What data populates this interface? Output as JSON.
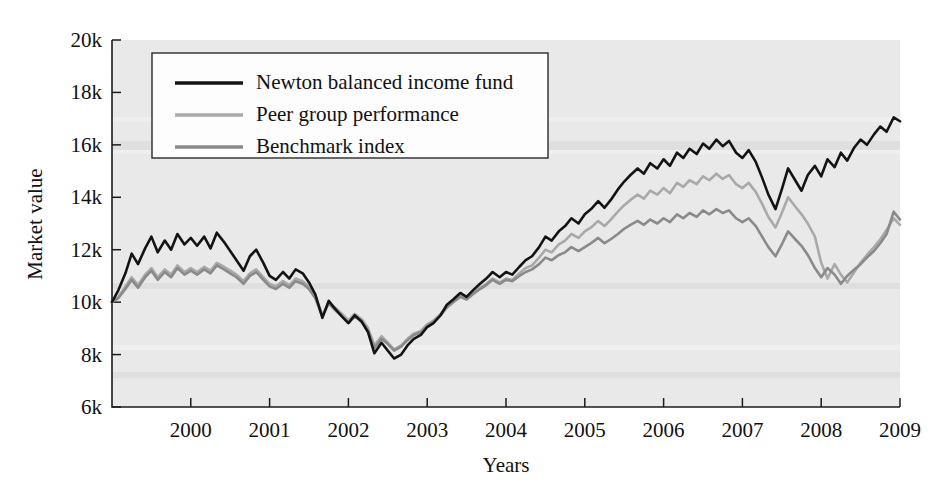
{
  "chart_data": {
    "type": "line",
    "title": "",
    "xlabel": "Years",
    "ylabel": "Market value",
    "xlim": [
      1999.0,
      2009.0
    ],
    "ylim": [
      6000,
      20000
    ],
    "xticks": [
      "2000",
      "2001",
      "2002",
      "2003",
      "2004",
      "2005",
      "2006",
      "2007",
      "2008",
      "2009"
    ],
    "xtick_values": [
      2000,
      2001,
      2002,
      2003,
      2004,
      2005,
      2006,
      2007,
      2008,
      2009
    ],
    "yticks": [
      "6k",
      "8k",
      "10k",
      "12k",
      "14k",
      "16k",
      "18k",
      "20k"
    ],
    "ytick_values": [
      6000,
      8000,
      10000,
      12000,
      14000,
      16000,
      18000,
      20000
    ],
    "grid": false,
    "legend_position": "top-left",
    "x": [
      1999.0,
      1999.08,
      1999.17,
      1999.25,
      1999.33,
      1999.42,
      1999.5,
      1999.58,
      1999.67,
      1999.75,
      1999.83,
      1999.92,
      2000.0,
      2000.08,
      2000.17,
      2000.25,
      2000.33,
      2000.42,
      2000.5,
      2000.58,
      2000.67,
      2000.75,
      2000.83,
      2000.92,
      2001.0,
      2001.08,
      2001.17,
      2001.25,
      2001.33,
      2001.42,
      2001.5,
      2001.58,
      2001.67,
      2001.75,
      2001.83,
      2001.92,
      2002.0,
      2002.08,
      2002.17,
      2002.25,
      2002.33,
      2002.42,
      2002.5,
      2002.58,
      2002.67,
      2002.75,
      2002.83,
      2002.92,
      2003.0,
      2003.08,
      2003.17,
      2003.25,
      2003.33,
      2003.42,
      2003.5,
      2003.58,
      2003.67,
      2003.75,
      2003.83,
      2003.92,
      2004.0,
      2004.08,
      2004.17,
      2004.25,
      2004.33,
      2004.42,
      2004.5,
      2004.58,
      2004.67,
      2004.75,
      2004.83,
      2004.92,
      2005.0,
      2005.08,
      2005.17,
      2005.25,
      2005.33,
      2005.42,
      2005.5,
      2005.58,
      2005.67,
      2005.75,
      2005.83,
      2005.92,
      2006.0,
      2006.08,
      2006.17,
      2006.25,
      2006.33,
      2006.42,
      2006.5,
      2006.58,
      2006.67,
      2006.75,
      2006.83,
      2006.92,
      2007.0,
      2007.08,
      2007.17,
      2007.25,
      2007.33,
      2007.42,
      2007.5,
      2007.58,
      2007.67,
      2007.75,
      2007.83,
      2007.92,
      2008.0,
      2008.08,
      2008.17,
      2008.25,
      2008.33,
      2008.42,
      2008.5,
      2008.58,
      2008.67,
      2008.75,
      2008.83,
      2008.92,
      2009.0
    ],
    "series": [
      {
        "name": "Newton balanced income fund",
        "color": "#141414",
        "width": 2.6,
        "values": [
          10000,
          10450,
          11100,
          11850,
          11450,
          12050,
          12500,
          11900,
          12350,
          12000,
          12600,
          12200,
          12450,
          12150,
          12500,
          12050,
          12650,
          12300,
          11950,
          11600,
          11200,
          11750,
          12000,
          11500,
          11000,
          10850,
          11150,
          10900,
          11250,
          11100,
          10750,
          10300,
          9400,
          10050,
          9750,
          9450,
          9200,
          9500,
          9250,
          8850,
          8050,
          8450,
          8150,
          7850,
          8000,
          8350,
          8600,
          8750,
          9050,
          9200,
          9500,
          9900,
          10100,
          10350,
          10200,
          10450,
          10700,
          10900,
          11150,
          10950,
          11150,
          11050,
          11350,
          11600,
          11750,
          12100,
          12500,
          12350,
          12700,
          12900,
          13200,
          13000,
          13350,
          13550,
          13850,
          13600,
          13900,
          14300,
          14600,
          14850,
          15100,
          14900,
          15300,
          15100,
          15450,
          15200,
          15700,
          15500,
          15850,
          15650,
          16050,
          15850,
          16200,
          15950,
          16150,
          15700,
          15500,
          15800,
          15350,
          14750,
          14100,
          13550,
          14300,
          15100,
          14650,
          14250,
          14850,
          15200,
          14800,
          15450,
          15150,
          15700,
          15400,
          15900,
          16200,
          16000,
          16400,
          16700,
          16500,
          17050,
          16900
        ]
      },
      {
        "name": "Peer group performance",
        "color": "#a9a9a9",
        "width": 2.6,
        "values": [
          10000,
          10200,
          10600,
          10950,
          10650,
          11050,
          11300,
          10950,
          11250,
          11050,
          11400,
          11150,
          11300,
          11150,
          11350,
          11200,
          11500,
          11350,
          11200,
          11050,
          10800,
          11100,
          11250,
          10950,
          10700,
          10600,
          10800,
          10650,
          10900,
          10800,
          10600,
          10250,
          9500,
          10000,
          9800,
          9550,
          9300,
          9550,
          9350,
          9000,
          8350,
          8700,
          8450,
          8200,
          8350,
          8600,
          8800,
          8900,
          9150,
          9300,
          9550,
          9850,
          10050,
          10250,
          10150,
          10350,
          10550,
          10700,
          10900,
          10750,
          10900,
          10850,
          11100,
          11300,
          11400,
          11700,
          12000,
          11900,
          12200,
          12350,
          12600,
          12450,
          12700,
          12850,
          13100,
          12900,
          13150,
          13450,
          13700,
          13900,
          14100,
          13950,
          14250,
          14100,
          14350,
          14150,
          14550,
          14400,
          14650,
          14500,
          14800,
          14650,
          14900,
          14700,
          14850,
          14500,
          14350,
          14550,
          14200,
          13750,
          13250,
          12850,
          13400,
          14000,
          13650,
          13350,
          13000,
          12500,
          11500,
          10900,
          11450,
          11050,
          10750,
          11150,
          11500,
          11800,
          12100,
          12400,
          12750,
          13200,
          12950
        ]
      },
      {
        "name": "Benchmark index",
        "color": "#8a8a8a",
        "width": 2.6,
        "values": [
          10000,
          10150,
          10500,
          10850,
          10550,
          10950,
          11200,
          10850,
          11150,
          10950,
          11300,
          11050,
          11200,
          11050,
          11250,
          11100,
          11400,
          11250,
          11100,
          10950,
          10700,
          11000,
          11150,
          10850,
          10600,
          10500,
          10700,
          10550,
          10800,
          10700,
          10500,
          10150,
          9450,
          9950,
          9700,
          9450,
          9200,
          9450,
          9250,
          8900,
          8250,
          8600,
          8400,
          8150,
          8300,
          8550,
          8750,
          8850,
          9100,
          9250,
          9500,
          9800,
          10000,
          10200,
          10100,
          10300,
          10500,
          10650,
          10850,
          10700,
          10850,
          10800,
          11000,
          11150,
          11250,
          11450,
          11700,
          11600,
          11800,
          11900,
          12100,
          11950,
          12100,
          12250,
          12450,
          12250,
          12400,
          12600,
          12800,
          12950,
          13100,
          12950,
          13150,
          13000,
          13200,
          13050,
          13350,
          13200,
          13400,
          13250,
          13500,
          13350,
          13550,
          13400,
          13500,
          13200,
          13050,
          13200,
          12900,
          12500,
          12100,
          11750,
          12200,
          12700,
          12400,
          12150,
          11800,
          11300,
          10950,
          11300,
          11050,
          10700,
          11000,
          11250,
          11450,
          11700,
          11950,
          12250,
          12600,
          13450,
          13150
        ]
      }
    ]
  },
  "legend": {
    "items": [
      {
        "label": "Newton balanced income fund",
        "color": "#141414"
      },
      {
        "label": "Peer group performance",
        "color": "#a9a9a9"
      },
      {
        "label": "Benchmark index",
        "color": "#8a8a8a"
      }
    ]
  }
}
